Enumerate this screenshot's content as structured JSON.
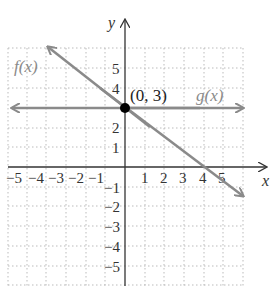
{
  "graph": {
    "x_axis_label": "x",
    "y_axis_label": "y",
    "x_range": [
      -5,
      5
    ],
    "y_range": [
      -5,
      5
    ],
    "x_ticks": [
      "−5",
      "−4",
      "−3",
      "−2",
      "−1",
      "1",
      "2",
      "3",
      "4",
      "5"
    ],
    "y_ticks": [
      "5",
      "4",
      "2",
      "1",
      "−1",
      "−2",
      "−3",
      "−4",
      "−5"
    ],
    "grid": "dotted",
    "functions": [
      {
        "name": "f(x)",
        "label": "f(x)",
        "type": "line",
        "slope": -0.75,
        "intercept": 3,
        "x_intercept": 4,
        "color": "#8a8a8a"
      },
      {
        "name": "g(x)",
        "label": "g(x)",
        "type": "line",
        "slope": 0,
        "intercept": 3,
        "color": "#8a8a8a"
      }
    ],
    "point": {
      "label": "(0, 3)",
      "x": 0,
      "y": 3,
      "color": "#000000"
    }
  }
}
